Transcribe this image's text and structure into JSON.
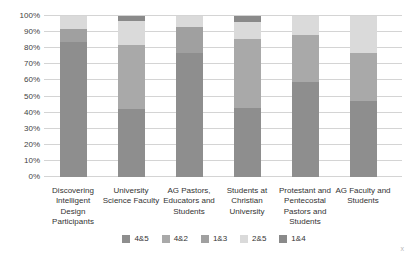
{
  "chart_data": {
    "type": "bar",
    "stacked": true,
    "percent_stacked": true,
    "title": "",
    "xlabel": "",
    "ylabel": "",
    "ylim": [
      0,
      100
    ],
    "grid": true,
    "legend_position": "bottom",
    "y_ticks": [
      "0%",
      "10%",
      "20%",
      "30%",
      "40%",
      "50%",
      "60%",
      "70%",
      "80%",
      "90%",
      "100%"
    ],
    "categories": [
      "Discovering Intelligent Design Participants",
      "University Science Faculty",
      "AG Pastors, Educators and Students",
      "Students at Christian University",
      "Protestant and Pentecostal Pastors and Students",
      "AG Faculty and Students"
    ],
    "series": [
      {
        "name": "4&5",
        "color": "#8e8e8e",
        "values": [
          84,
          42,
          77,
          43,
          59,
          47
        ]
      },
      {
        "name": "4&2",
        "color": "#a9a9a9",
        "values": [
          0,
          40,
          0,
          43,
          29,
          30
        ]
      },
      {
        "name": "1&3",
        "color": "#a0a0a0",
        "values": [
          8,
          0,
          16,
          0,
          0,
          0
        ]
      },
      {
        "name": "2&5",
        "color": "#dadada",
        "values": [
          8,
          15,
          7,
          10,
          12,
          23
        ]
      },
      {
        "name": "1&4",
        "color": "#8a8a8a",
        "values": [
          0,
          3,
          0,
          4,
          0,
          0
        ]
      }
    ]
  },
  "colors": {
    "gridline": "#d4d4d4",
    "tick_text": "#3f3f3f",
    "label_text": "#333333",
    "background": "#ffffff"
  },
  "artifact": {
    "corner_mark": "x"
  }
}
